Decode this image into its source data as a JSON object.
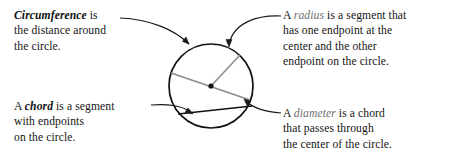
{
  "figure": {
    "background_color": "#ffffff",
    "text_color": "#151515",
    "term_highlight_color": "#6d6d6d",
    "circle_stroke_color": "#111111",
    "segment_stroke_color": "#8b8b8b",
    "chord_stroke_color": "#111111",
    "leader_stroke_color": "#1a1a1a"
  },
  "callouts": {
    "circumference": {
      "term": "Circumference",
      "rest_line1": " is",
      "line2": "the distance around",
      "line3": "the circle."
    },
    "chord": {
      "lead": "A ",
      "term": "chord",
      "rest_line1": " is a segment",
      "line2": "with endpoints",
      "line3": "on the circle."
    },
    "radius": {
      "lead": "A ",
      "term": "radius",
      "rest_line1": " is a segment that",
      "line2": "has one endpoint at the",
      "line3": "center and the other",
      "line4": "endpoint on the circle."
    },
    "diameter": {
      "lead": "A ",
      "term": "diameter",
      "rest_line1": " is a chord",
      "line2": "that passes through",
      "line3": "the center of the circle."
    }
  },
  "diagram": {
    "circle": {
      "cx": 211,
      "cy": 86,
      "r": 42
    },
    "center_point": {
      "cx": 211,
      "cy": 86,
      "r": 2.6
    },
    "radius_segment": {
      "x1": 211,
      "y1": 86,
      "x2": 240,
      "y2": 55
    },
    "diameter_segment": {
      "x1": 171,
      "y1": 73,
      "x2": 250,
      "y2": 100
    },
    "chord_segment": {
      "x1": 178,
      "y1": 114,
      "x2": 252,
      "y2": 106
    }
  }
}
